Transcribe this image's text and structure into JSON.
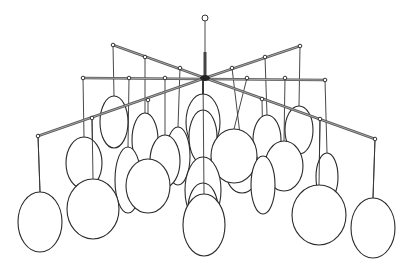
{
  "image": {
    "subject": "Line drawing of a hanging mobile chandelier with spheres",
    "background": "#ffffff",
    "line_color": "#2a2a2a",
    "hub": {
      "x": 205,
      "y": 78
    },
    "top_ring": {
      "x": 205,
      "y": 18,
      "r": 3
    },
    "rods": [
      {
        "name": "upper-left",
        "x1": 205,
        "y1": 78,
        "x2": 113,
        "y2": 45
      },
      {
        "name": "horizontal",
        "x1": 83,
        "y1": 78,
        "x2": 325,
        "y2": 80
      },
      {
        "name": "lower-left",
        "x1": 205,
        "y1": 78,
        "x2": 38,
        "y2": 136
      },
      {
        "name": "upper-right",
        "x1": 205,
        "y1": 78,
        "x2": 300,
        "y2": 46
      },
      {
        "name": "lower-right",
        "x1": 205,
        "y1": 78,
        "x2": 375,
        "y2": 139
      }
    ],
    "spheres_back": [
      {
        "cx": 203,
        "cy": 122,
        "rx": 17,
        "ry": 28,
        "hang_x": 203,
        "hang_y": 78
      },
      {
        "cx": 114,
        "cy": 122,
        "rx": 14,
        "ry": 26,
        "hang_x": 113,
        "hang_y": 45
      },
      {
        "cx": 299,
        "cy": 130,
        "rx": 14,
        "ry": 24,
        "hang_x": 300,
        "hang_y": 46
      },
      {
        "cx": 145,
        "cy": 140,
        "rx": 13,
        "ry": 27,
        "hang_x": 145,
        "hang_y": 57
      },
      {
        "cx": 267,
        "cy": 140,
        "rx": 14,
        "ry": 25,
        "hang_x": 265,
        "hang_y": 57
      },
      {
        "cx": 203,
        "cy": 137,
        "rx": 14,
        "ry": 27,
        "hang_x": 203,
        "hang_y": 78
      },
      {
        "cx": 178,
        "cy": 156,
        "rx": 12,
        "ry": 29,
        "hang_x": 180,
        "hang_y": 68
      },
      {
        "cx": 242,
        "cy": 172,
        "rx": 16,
        "ry": 21,
        "hang_x": 232,
        "hang_y": 68
      },
      {
        "cx": 84,
        "cy": 163,
        "rx": 18,
        "ry": 26,
        "hang_x": 83,
        "hang_y": 78
      },
      {
        "cx": 165,
        "cy": 161,
        "rx": 15,
        "ry": 26,
        "hang_x": 165,
        "hang_y": 78
      },
      {
        "cx": 128,
        "cy": 180,
        "rx": 13,
        "ry": 33,
        "hang_x": 129,
        "hang_y": 78
      },
      {
        "cx": 327,
        "cy": 177,
        "rx": 11,
        "ry": 24,
        "hang_x": 325,
        "hang_y": 80
      },
      {
        "cx": 284,
        "cy": 166,
        "rx": 19,
        "ry": 25,
        "hang_x": 285,
        "hang_y": 78
      },
      {
        "cx": 234,
        "cy": 156,
        "rx": 23,
        "ry": 27,
        "hang_x": 247,
        "hang_y": 78
      },
      {
        "cx": 203,
        "cy": 190,
        "rx": 18,
        "ry": 33,
        "hang_x": 203,
        "hang_y": 78
      },
      {
        "cx": 263,
        "cy": 185,
        "rx": 12,
        "ry": 29,
        "hang_x": 262,
        "hang_y": 99
      },
      {
        "cx": 148,
        "cy": 186,
        "rx": 22,
        "ry": 27,
        "hang_x": 148,
        "hang_y": 100
      },
      {
        "cx": 203,
        "cy": 209,
        "rx": 15,
        "ry": 26,
        "hang_x": 203,
        "hang_y": 78
      }
    ],
    "spheres_front": [
      {
        "cx": 93,
        "cy": 209,
        "rx": 26,
        "ry": 30,
        "hang_x": 92,
        "hang_y": 118
      },
      {
        "cx": 319,
        "cy": 215,
        "rx": 27,
        "ry": 30,
        "hang_x": 320,
        "hang_y": 119
      },
      {
        "cx": 204,
        "cy": 225,
        "rx": 21,
        "ry": 31,
        "hang_x": 203,
        "hang_y": 78
      },
      {
        "cx": 40,
        "cy": 222,
        "rx": 22,
        "ry": 30,
        "hang_x": 38,
        "hang_y": 136
      },
      {
        "cx": 373,
        "cy": 228,
        "rx": 22,
        "ry": 30,
        "hang_x": 375,
        "hang_y": 139
      }
    ],
    "nodes": [
      {
        "x": 113,
        "y": 45
      },
      {
        "x": 145,
        "y": 57
      },
      {
        "x": 180,
        "y": 68
      },
      {
        "x": 300,
        "y": 46
      },
      {
        "x": 265,
        "y": 57
      },
      {
        "x": 232,
        "y": 68
      },
      {
        "x": 83,
        "y": 78
      },
      {
        "x": 129,
        "y": 78
      },
      {
        "x": 165,
        "y": 78
      },
      {
        "x": 247,
        "y": 78
      },
      {
        "x": 285,
        "y": 78
      },
      {
        "x": 325,
        "y": 80
      },
      {
        "x": 38,
        "y": 136
      },
      {
        "x": 92,
        "y": 118
      },
      {
        "x": 148,
        "y": 100
      },
      {
        "x": 375,
        "y": 139
      },
      {
        "x": 320,
        "y": 119
      },
      {
        "x": 262,
        "y": 99
      }
    ]
  }
}
